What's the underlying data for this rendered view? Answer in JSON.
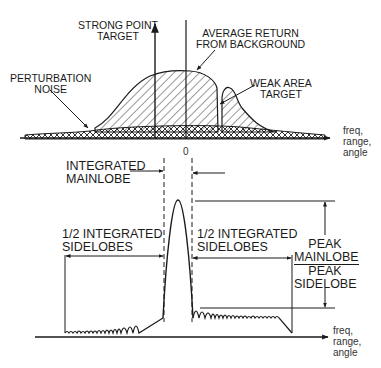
{
  "top_diagram": {
    "labels": {
      "strong_point_target": [
        "STRONG POINT",
        "TARGET"
      ],
      "average_return": [
        "AVERAGE RETURN",
        "FROM BACKGROUND"
      ],
      "perturbation_noise": [
        "PERTURBATION",
        "NOISE"
      ],
      "weak_area_target": [
        "WEAK AREA",
        "TARGET"
      ],
      "axis_label": [
        "freq,",
        "range,",
        "angle"
      ],
      "origin": "0"
    }
  },
  "bottom_diagram": {
    "labels": {
      "integrated_mainlobe": [
        "INTEGRATED",
        "MAINLOBE"
      ],
      "half_sidelobes_left": [
        "1/2 INTEGRATED",
        "SIDELOBES"
      ],
      "half_sidelobes_right": [
        "1/2 INTEGRATED",
        "SIDELOBES"
      ],
      "ratio_numerator": [
        "PEAK",
        "MAINLOBE"
      ],
      "ratio_denominator": [
        "PEAK",
        "SIDELOBE"
      ],
      "axis_label": [
        "freq,",
        "range,",
        "angle"
      ]
    }
  },
  "colors": {
    "ink": "#1a1a1a",
    "background": "#ffffff"
  }
}
